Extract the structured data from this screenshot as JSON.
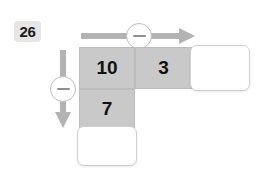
{
  "exercise": {
    "number": "26",
    "type": "subtraction-grid-puzzle"
  },
  "operators": {
    "horizontal": {
      "symbol": "−",
      "name": "minus-icon",
      "direction": "right"
    },
    "vertical": {
      "symbol": "−",
      "name": "minus-icon",
      "direction": "down"
    }
  },
  "grid": {
    "top_row": [
      {
        "value": "10",
        "filled": true
      },
      {
        "value": "3",
        "filled": true
      },
      {
        "value": "",
        "filled": false
      }
    ],
    "left_column": [
      {
        "value": "7",
        "filled": true
      },
      {
        "value": "",
        "filled": false
      }
    ]
  },
  "colors": {
    "cell_fill": "#c9c9c9",
    "arrow": "#b3b3b3",
    "badge": "#e6e6e6",
    "text": "#111111",
    "blank_border": "#cfcfcf"
  }
}
